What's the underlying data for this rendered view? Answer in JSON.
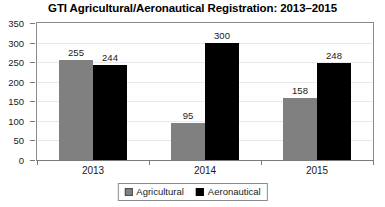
{
  "chart_data": {
    "type": "bar",
    "title": "GTI Agricultural/Aeronautical Registration: 2013–2015",
    "xlabel": "",
    "ylabel": "",
    "categories": [
      "2013",
      "2014",
      "2015"
    ],
    "series": [
      {
        "name": "Agricultural",
        "color": "#808080",
        "values": [
          255,
          95,
          158
        ]
      },
      {
        "name": "Aeronautical",
        "color": "#000000",
        "values": [
          244,
          300,
          248
        ]
      }
    ],
    "ylim": [
      0,
      350
    ],
    "y_ticks": [
      0,
      50,
      100,
      150,
      200,
      250,
      300,
      350
    ],
    "y_tick_labels": [
      "0",
      "50",
      "100",
      "150",
      "200",
      "250",
      "300",
      "350"
    ],
    "grid": true,
    "data_labels": true,
    "legend": {
      "position": "bottom",
      "entries": [
        {
          "label": "Agricultural",
          "swatch": "#808080"
        },
        {
          "label": "Aeronautical",
          "swatch": "#000000"
        }
      ]
    }
  }
}
